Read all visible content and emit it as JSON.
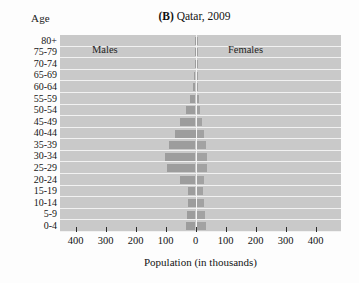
{
  "figure": {
    "title_prefix": "(B)",
    "title_text": "Qatar, 2009",
    "y_axis_title": "Age",
    "x_axis_title": "Population (in thousands)",
    "legend_male": "Males",
    "legend_female": "Females",
    "bar_color": "#9d9d9d",
    "plot_background": "#c9c9c9",
    "gridline_color": "#f2f2f2"
  },
  "chart_data": {
    "type": "bar",
    "subtype": "population-pyramid",
    "title": "(B) Qatar, 2009",
    "xlabel": "Population (in thousands)",
    "ylabel": "Age",
    "xlim": [
      -400,
      400
    ],
    "xticks": [
      400,
      300,
      200,
      100,
      0,
      100,
      200,
      300,
      400
    ],
    "xtick_labels": [
      "400",
      "300",
      "200",
      "100",
      "0",
      "100",
      "200",
      "300",
      "400"
    ],
    "grid": true,
    "legend": [
      "Males",
      "Females"
    ],
    "legend_position": "inside-top",
    "categories": [
      "0-4",
      "5-9",
      "10-14",
      "15-19",
      "20-24",
      "25-29",
      "30-34",
      "35-39",
      "40-44",
      "45-49",
      "50-54",
      "55-59",
      "60-64",
      "65-69",
      "70-74",
      "75-79",
      "80+"
    ],
    "series": [
      {
        "name": "Males",
        "side": "left",
        "values": [
          32,
          28,
          25,
          24,
          52,
          96,
          102,
          88,
          70,
          52,
          33,
          18,
          9,
          4,
          2,
          1,
          1
        ]
      },
      {
        "name": "Females",
        "side": "right",
        "values": [
          31,
          27,
          23,
          20,
          25,
          33,
          35,
          30,
          24,
          17,
          11,
          6,
          4,
          2,
          1,
          1,
          1
        ]
      }
    ]
  },
  "y_tick_labels": [
    "80+",
    "75-79",
    "70-74",
    "65-69",
    "60-64",
    "55-59",
    "50-54",
    "45-49",
    "40-44",
    "35-39",
    "30-34",
    "25-29",
    "20-24",
    "15-19",
    "10-14",
    "5-9",
    "0-4"
  ]
}
